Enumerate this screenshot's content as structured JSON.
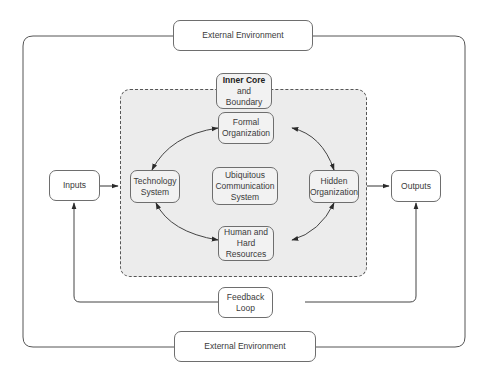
{
  "diagram": {
    "external_top": {
      "label": "External Environment"
    },
    "external_bottom": {
      "label": "External Environment"
    },
    "inner_core": {
      "line1": "Inner Core",
      "line2": "and",
      "line3": "Boundary"
    },
    "inputs": {
      "label": "Inputs"
    },
    "outputs": {
      "label": "Outputs"
    },
    "formal_org": {
      "line1": "Formal",
      "line2": "Organization"
    },
    "technology": {
      "line1": "Technology",
      "line2": "System"
    },
    "ubiquitous": {
      "line1": "Ubiquitous",
      "line2": "Communication",
      "line3": "System"
    },
    "hidden_org": {
      "line1": "Hidden",
      "line2": "Organization"
    },
    "human": {
      "line1": "Human and",
      "line2": "Hard",
      "line3": "Resources"
    },
    "feedback": {
      "label": "Feedback Loop"
    },
    "colors": {
      "line": "#4a4a4a",
      "core_fill": "#ececec",
      "box_border": "#6e6e6e"
    }
  }
}
